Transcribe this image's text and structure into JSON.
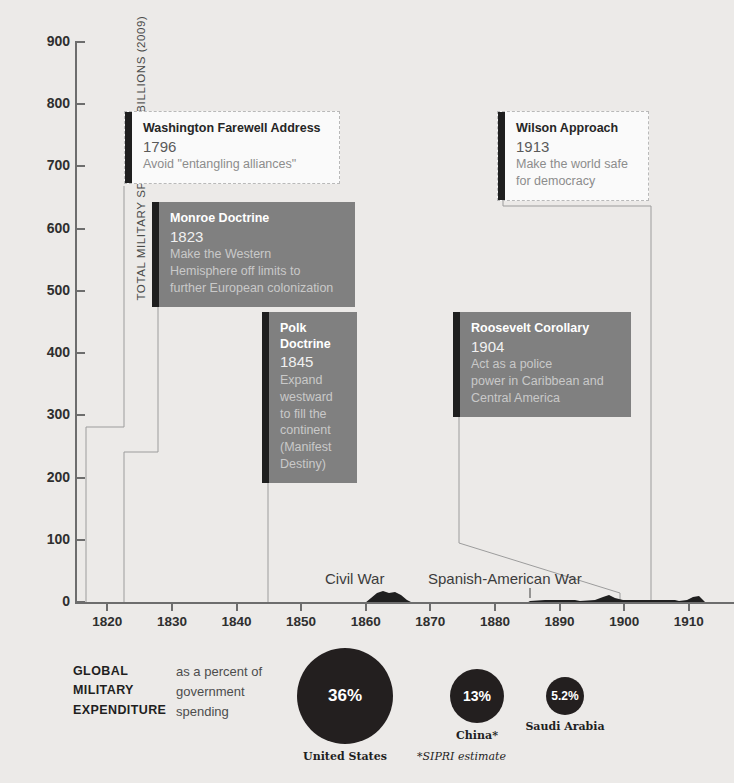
{
  "chart_data": {
    "type": "area",
    "title": "",
    "ylabel": "TOTAL MILITARY SPENDING IN BILLIONS (2009)",
    "xlabel": "",
    "ylim": [
      0,
      900
    ],
    "xlim": [
      1815,
      1917
    ],
    "yticks": [
      900,
      800,
      700,
      600,
      500,
      400,
      300,
      200,
      100,
      0
    ],
    "xticks": [
      1820,
      1830,
      1840,
      1850,
      1860,
      1870,
      1880,
      1890,
      1900,
      1910
    ],
    "grid": false,
    "legend": "none",
    "series": [
      {
        "name": "Total military spending (billions, 2009 dollars)",
        "x": [
          1815,
          1840,
          1846,
          1848,
          1855,
          1860,
          1861,
          1862,
          1863,
          1864,
          1865,
          1866,
          1870,
          1875,
          1880,
          1885,
          1886,
          1890,
          1893,
          1895,
          1897,
          1898,
          1899,
          1900,
          1903,
          1905,
          1906,
          1910,
          1913
        ],
        "values": [
          1,
          1,
          2,
          3,
          1,
          1,
          6,
          16,
          20,
          18,
          14,
          5,
          2,
          2,
          2,
          3,
          8,
          9,
          9,
          8,
          9,
          17,
          12,
          11,
          11,
          20,
          3,
          3,
          3
        ]
      }
    ],
    "annotations": [
      {
        "label": "Civil War",
        "year": 1862,
        "value_at_peak": 20
      },
      {
        "label": "Spanish-American War",
        "year": 1898,
        "value_at_peak": 17
      }
    ]
  },
  "axis": {
    "y_title": "TOTAL MILITARY SPENDING IN BILLIONS (2009)",
    "y_ticks": [
      "900",
      "800",
      "700",
      "600",
      "500",
      "400",
      "300",
      "200",
      "100",
      "0"
    ],
    "x_ticks": [
      "1820",
      "1830",
      "1840",
      "1850",
      "1860",
      "1870",
      "1880",
      "1890",
      "1900",
      "1910"
    ]
  },
  "wars": [
    {
      "label": "Civil War"
    },
    {
      "label": "Spanish-American War"
    }
  ],
  "callouts": [
    {
      "id": "washington",
      "title": "Washington Farewell Address",
      "year": "1796",
      "desc": "Avoid \"entangling alliances\"",
      "style": "light"
    },
    {
      "id": "monroe",
      "title": "Monroe Doctrine",
      "year": "1823",
      "desc": "Make the Western\nHemisphere off limits to\nfurther European colonization",
      "style": "dark"
    },
    {
      "id": "polk",
      "title": "Polk Doctrine",
      "year": "1845",
      "desc": "Expand westward\nto fill the continent\n(Manifest Destiny)",
      "style": "dark"
    },
    {
      "id": "roosevelt",
      "title": "Roosevelt Corollary",
      "year": "1904",
      "desc": "Act as a police\npower in Caribbean and\nCentral America",
      "style": "dark"
    },
    {
      "id": "wilson",
      "title": "Wilson Approach",
      "year": "1913",
      "desc": "Make the world safe\nfor democracy",
      "style": "light"
    }
  ],
  "bottom": {
    "heading": "GLOBAL\nMILITARY\nEXPENDITURE",
    "subtitle": "as a percent of\ngovernment\nspending",
    "footnote": "*SIPRI estimate",
    "bubbles": [
      {
        "value": "36%",
        "caption": "United States"
      },
      {
        "value": "13%",
        "caption": "China*"
      },
      {
        "value": "5.2%",
        "caption": "Saudi Arabia"
      }
    ]
  },
  "colors": {
    "background": "#eceae8",
    "ink": "#231f1f",
    "callout_dark": "#808080",
    "callout_light": "#fafafa",
    "axis": "#6d6d6d",
    "leader": "#9c9c9c"
  }
}
